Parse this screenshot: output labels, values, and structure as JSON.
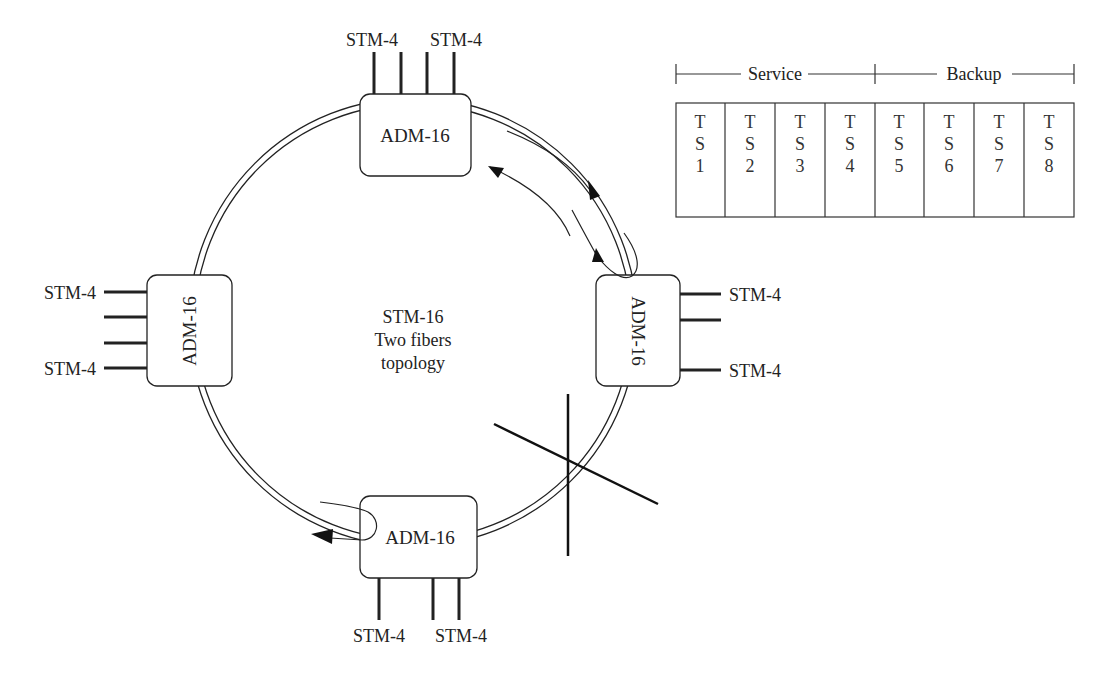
{
  "diagram": {
    "center_label": [
      "STM-16",
      "Two fibers",
      "topology"
    ],
    "nodes": [
      {
        "id": "top",
        "label": "ADM-16",
        "tributaries": [
          "STM-4",
          "STM-4"
        ]
      },
      {
        "id": "right",
        "label": "ADM-16",
        "tributaries": [
          "STM-4",
          "STM-4"
        ]
      },
      {
        "id": "bottom",
        "label": "ADM-16",
        "tributaries": [
          "STM-4",
          "STM-4"
        ]
      },
      {
        "id": "left",
        "label": "ADM-16",
        "tributaries": [
          "STM-4",
          "STM-4"
        ]
      }
    ],
    "fault": "fiber cut between right and bottom ADM-16",
    "timeslot_frame": {
      "groups": [
        {
          "label": "Service",
          "slots": [
            1,
            2,
            3,
            4
          ]
        },
        {
          "label": "Backup",
          "slots": [
            5,
            6,
            7,
            8
          ]
        }
      ],
      "slots": [
        {
          "lines": [
            "T",
            "S",
            "1"
          ]
        },
        {
          "lines": [
            "T",
            "S",
            "2"
          ]
        },
        {
          "lines": [
            "T",
            "S",
            "3"
          ]
        },
        {
          "lines": [
            "T",
            "S",
            "4"
          ]
        },
        {
          "lines": [
            "T",
            "S",
            "5"
          ]
        },
        {
          "lines": [
            "T",
            "S",
            "6"
          ]
        },
        {
          "lines": [
            "T",
            "S",
            "7"
          ]
        },
        {
          "lines": [
            "T",
            "S",
            "8"
          ]
        }
      ]
    }
  },
  "colors": {
    "stroke": "#222222",
    "background": "#ffffff"
  }
}
